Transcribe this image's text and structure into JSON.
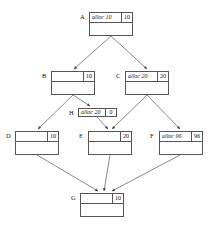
{
  "diagram": {
    "type": "directed-graph",
    "width": 218,
    "height": 233,
    "background_color": "#ffffff",
    "box_border_color": "#555555",
    "edge_color": "#555555",
    "text_color": "#111111"
  },
  "nodes": [
    {
      "id": "A",
      "label": "A",
      "statement": "alloc 10",
      "value": "10",
      "has_statement": true,
      "compact": false,
      "x": 89,
      "y": 12,
      "width": 44,
      "height": 24
    },
    {
      "id": "B",
      "label": "B",
      "statement": "",
      "value": "10",
      "has_statement": false,
      "compact": false,
      "x": 51,
      "y": 71,
      "width": 44,
      "height": 24
    },
    {
      "id": "C",
      "label": "C",
      "statement": "alloc 20",
      "value": "20",
      "has_statement": true,
      "compact": false,
      "x": 125,
      "y": 71,
      "width": 44,
      "height": 24
    },
    {
      "id": "H",
      "label": "H",
      "statement": "alloc 20",
      "value": "0",
      "has_statement": true,
      "compact": true,
      "x": 78,
      "y": 108,
      "width": 39,
      "height": 9
    },
    {
      "id": "D",
      "label": "D",
      "statement": "",
      "value": "10",
      "has_statement": false,
      "compact": false,
      "x": 15,
      "y": 131,
      "width": 44,
      "height": 24
    },
    {
      "id": "E",
      "label": "E",
      "statement": "",
      "value": "20",
      "has_statement": false,
      "compact": false,
      "x": 88,
      "y": 131,
      "width": 44,
      "height": 24
    },
    {
      "id": "F",
      "label": "F",
      "statement": "alloc 96",
      "value": "96",
      "has_statement": true,
      "compact": false,
      "x": 159,
      "y": 131,
      "width": 44,
      "height": 24
    },
    {
      "id": "G",
      "label": "G",
      "statement": "",
      "value": "10",
      "has_statement": false,
      "compact": false,
      "x": 80,
      "y": 193,
      "width": 44,
      "height": 24
    }
  ],
  "edges": [
    {
      "from": "A",
      "to": "B",
      "path": "M 111 36 L 74 69"
    },
    {
      "from": "A",
      "to": "C",
      "path": "M 111 36 L 147 69"
    },
    {
      "from": "B",
      "to": "D",
      "path": "M 73 95 L 38 129"
    },
    {
      "from": "B",
      "to": "H",
      "path": "M 73 95 L 90 106"
    },
    {
      "from": "H",
      "to": "E",
      "path": "M 97 117 L 108 129"
    },
    {
      "from": "C",
      "to": "E",
      "path": "M 147 95 L 112 129"
    },
    {
      "from": "C",
      "to": "F",
      "path": "M 147 95 L 180 129"
    },
    {
      "from": "D",
      "to": "G",
      "path": "M 37 155 L 98 191"
    },
    {
      "from": "E",
      "to": "G",
      "path": "M 110 155 L 104 191"
    },
    {
      "from": "F",
      "to": "G",
      "path": "M 180 155 L 112 191"
    }
  ]
}
